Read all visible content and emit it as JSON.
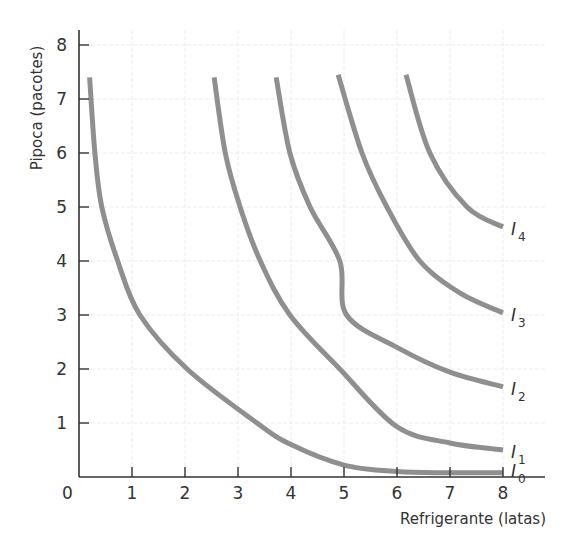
{
  "chart_data": {
    "type": "line",
    "title": "",
    "xlabel": "Refrigerante (latas)",
    "ylabel": "Pipoca (pacotes)",
    "xlim": [
      0,
      8
    ],
    "ylim": [
      0,
      8
    ],
    "xticks": [
      "0",
      "1",
      "2",
      "3",
      "4",
      "5",
      "6",
      "7",
      "8"
    ],
    "yticks": [
      "1",
      "2",
      "3",
      "4",
      "5",
      "6",
      "7",
      "8"
    ],
    "origin_label": "0",
    "grid": true,
    "legend": "none (curves labeled inline at right end)",
    "series": [
      {
        "name": "I0",
        "label_main": "I",
        "label_sub": "0",
        "color": "#8f8f8f",
        "points": [
          [
            0.2,
            7.4
          ],
          [
            0.3,
            6.0
          ],
          [
            0.43,
            5.0
          ],
          [
            0.73,
            4.0
          ],
          [
            1.15,
            3.0
          ],
          [
            2.04,
            2.0
          ],
          [
            3.36,
            1.0
          ],
          [
            4.0,
            0.6
          ],
          [
            5.0,
            0.22
          ],
          [
            6.0,
            0.1
          ],
          [
            7.0,
            0.08
          ],
          [
            8.0,
            0.08
          ]
        ]
      },
      {
        "name": "I1",
        "label_main": "I",
        "label_sub": "1",
        "color": "#8f8f8f",
        "points": [
          [
            2.55,
            7.4
          ],
          [
            2.76,
            6.0
          ],
          [
            3.04,
            5.0
          ],
          [
            3.42,
            4.0
          ],
          [
            3.98,
            3.0
          ],
          [
            4.92,
            2.0
          ],
          [
            6.0,
            0.93
          ],
          [
            7.0,
            0.63
          ],
          [
            8.0,
            0.5
          ]
        ]
      },
      {
        "name": "I2",
        "label_main": "I",
        "label_sub": "2",
        "color": "#8f8f8f",
        "points": [
          [
            3.72,
            7.4
          ],
          [
            3.98,
            6.0
          ],
          [
            4.36,
            5.0
          ],
          [
            4.92,
            4.0
          ],
          [
            5.05,
            3.0
          ],
          [
            6.0,
            2.4
          ],
          [
            7.0,
            1.94
          ],
          [
            8.0,
            1.67
          ]
        ]
      },
      {
        "name": "I3",
        "label_main": "I",
        "label_sub": "3",
        "color": "#8f8f8f",
        "points": [
          [
            4.89,
            7.45
          ],
          [
            5.34,
            6.0
          ],
          [
            5.81,
            5.0
          ],
          [
            6.43,
            4.0
          ],
          [
            7.2,
            3.4
          ],
          [
            8.0,
            3.04
          ]
        ]
      },
      {
        "name": "I4",
        "label_main": "I",
        "label_sub": "4",
        "color": "#8f8f8f",
        "points": [
          [
            6.17,
            7.45
          ],
          [
            6.62,
            6.0
          ],
          [
            7.32,
            5.0
          ],
          [
            8.0,
            4.63
          ]
        ]
      }
    ]
  }
}
